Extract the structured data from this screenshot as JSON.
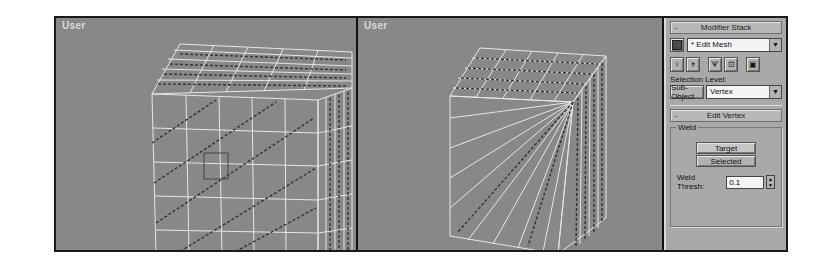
{
  "viewports": [
    {
      "label": "User",
      "mode": "front face vertices grid"
    },
    {
      "label": "User",
      "mode": "front face vertices welded to corner"
    }
  ],
  "modifier_stack": {
    "header": "Modifier Stack",
    "collapse_sign": "-",
    "pin_icon": "pin-stack-icon",
    "current_modifier": "* Edit Mesh",
    "stack_buttons": [
      {
        "icon": "pin-icon"
      },
      {
        "icon": "show-end-result-icon"
      },
      {
        "icon": "make-unique-icon"
      },
      {
        "icon": "remove-modifier-icon"
      },
      {
        "icon": "configure-sets-icon"
      }
    ],
    "selection_level_label": "Selection Level:",
    "sub_object_button": "Sub-Object",
    "sub_object_value": "Vertex"
  },
  "edit_vertex": {
    "header": "Edit Vertex",
    "collapse_sign": "-",
    "weld_group": "Weld",
    "target_button": "Target",
    "selected_button": "Selected",
    "weld_thresh_label": "Weld Thresh:",
    "weld_thresh_value": "0.1"
  },
  "colors": {
    "viewport_bg": "#888888",
    "panel_bg": "#a9a9a9",
    "wire": "#e6e6e6",
    "selected_vertex": "#333333"
  }
}
